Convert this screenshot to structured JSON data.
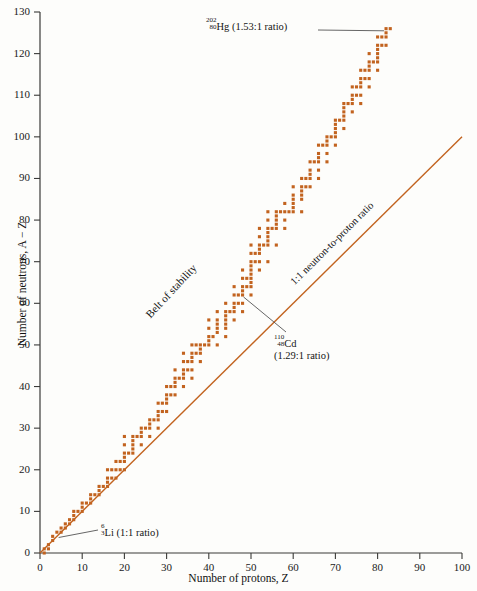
{
  "chart_data": {
    "type": "scatter",
    "title": "",
    "xlabel": "Number of protons, Z",
    "ylabel": "Number of neutrons, A − Z",
    "xlim": [
      0,
      100
    ],
    "ylim": [
      0,
      130
    ],
    "xticks": [
      0,
      10,
      20,
      30,
      40,
      50,
      60,
      70,
      80,
      90,
      100
    ],
    "yticks": [
      0,
      10,
      20,
      30,
      40,
      50,
      60,
      70,
      80,
      90,
      100,
      110,
      120,
      130
    ],
    "grid": false,
    "legend_position": "none",
    "series": [
      {
        "name": "Stable nuclides (belt of stability)",
        "color": "#C2631F",
        "marker": "square",
        "points": [
          [
            1,
            0
          ],
          [
            1,
            1
          ],
          [
            2,
            1
          ],
          [
            2,
            2
          ],
          [
            3,
            3
          ],
          [
            3,
            4
          ],
          [
            4,
            5
          ],
          [
            5,
            5
          ],
          [
            5,
            6
          ],
          [
            6,
            6
          ],
          [
            6,
            7
          ],
          [
            7,
            7
          ],
          [
            7,
            8
          ],
          [
            8,
            8
          ],
          [
            8,
            9
          ],
          [
            8,
            10
          ],
          [
            9,
            10
          ],
          [
            10,
            10
          ],
          [
            10,
            11
          ],
          [
            10,
            12
          ],
          [
            11,
            12
          ],
          [
            12,
            12
          ],
          [
            12,
            13
          ],
          [
            12,
            14
          ],
          [
            13,
            14
          ],
          [
            14,
            14
          ],
          [
            14,
            15
          ],
          [
            14,
            16
          ],
          [
            15,
            16
          ],
          [
            16,
            16
          ],
          [
            16,
            17
          ],
          [
            16,
            18
          ],
          [
            16,
            20
          ],
          [
            17,
            18
          ],
          [
            17,
            20
          ],
          [
            18,
            18
          ],
          [
            18,
            20
          ],
          [
            18,
            22
          ],
          [
            19,
            20
          ],
          [
            19,
            22
          ],
          [
            20,
            20
          ],
          [
            20,
            22
          ],
          [
            20,
            23
          ],
          [
            20,
            24
          ],
          [
            20,
            26
          ],
          [
            20,
            28
          ],
          [
            21,
            24
          ],
          [
            22,
            24
          ],
          [
            22,
            25
          ],
          [
            22,
            26
          ],
          [
            22,
            27
          ],
          [
            22,
            28
          ],
          [
            23,
            28
          ],
          [
            24,
            26
          ],
          [
            24,
            28
          ],
          [
            24,
            29
          ],
          [
            24,
            30
          ],
          [
            25,
            30
          ],
          [
            26,
            28
          ],
          [
            26,
            30
          ],
          [
            26,
            31
          ],
          [
            26,
            32
          ],
          [
            27,
            32
          ],
          [
            28,
            30
          ],
          [
            28,
            32
          ],
          [
            28,
            33
          ],
          [
            28,
            34
          ],
          [
            28,
            36
          ],
          [
            29,
            34
          ],
          [
            29,
            36
          ],
          [
            30,
            34
          ],
          [
            30,
            36
          ],
          [
            30,
            37
          ],
          [
            30,
            38
          ],
          [
            30,
            40
          ],
          [
            31,
            38
          ],
          [
            31,
            40
          ],
          [
            32,
            38
          ],
          [
            32,
            40
          ],
          [
            32,
            41
          ],
          [
            32,
            42
          ],
          [
            32,
            44
          ],
          [
            33,
            42
          ],
          [
            34,
            40
          ],
          [
            34,
            42
          ],
          [
            34,
            43
          ],
          [
            34,
            44
          ],
          [
            34,
            46
          ],
          [
            34,
            48
          ],
          [
            35,
            44
          ],
          [
            35,
            46
          ],
          [
            36,
            42
          ],
          [
            36,
            44
          ],
          [
            36,
            46
          ],
          [
            36,
            47
          ],
          [
            36,
            48
          ],
          [
            36,
            50
          ],
          [
            37,
            48
          ],
          [
            37,
            50
          ],
          [
            38,
            46
          ],
          [
            38,
            48
          ],
          [
            38,
            49
          ],
          [
            38,
            50
          ],
          [
            39,
            50
          ],
          [
            40,
            50
          ],
          [
            40,
            51
          ],
          [
            40,
            52
          ],
          [
            40,
            54
          ],
          [
            40,
            56
          ],
          [
            41,
            52
          ],
          [
            42,
            50
          ],
          [
            42,
            53
          ],
          [
            42,
            54
          ],
          [
            42,
            55
          ],
          [
            42,
            56
          ],
          [
            42,
            58
          ],
          [
            44,
            52
          ],
          [
            44,
            54
          ],
          [
            44,
            55
          ],
          [
            44,
            56
          ],
          [
            44,
            57
          ],
          [
            44,
            58
          ],
          [
            44,
            60
          ],
          [
            45,
            58
          ],
          [
            46,
            56
          ],
          [
            46,
            58
          ],
          [
            46,
            59
          ],
          [
            46,
            60
          ],
          [
            46,
            62
          ],
          [
            46,
            64
          ],
          [
            47,
            60
          ],
          [
            47,
            62
          ],
          [
            48,
            58
          ],
          [
            48,
            60
          ],
          [
            48,
            62
          ],
          [
            48,
            63
          ],
          [
            48,
            64
          ],
          [
            48,
            66
          ],
          [
            48,
            68
          ],
          [
            49,
            64
          ],
          [
            49,
            66
          ],
          [
            50,
            62
          ],
          [
            50,
            64
          ],
          [
            50,
            65
          ],
          [
            50,
            66
          ],
          [
            50,
            67
          ],
          [
            50,
            68
          ],
          [
            50,
            69
          ],
          [
            50,
            70
          ],
          [
            50,
            72
          ],
          [
            50,
            74
          ],
          [
            51,
            70
          ],
          [
            51,
            72
          ],
          [
            52,
            68
          ],
          [
            52,
            70
          ],
          [
            52,
            72
          ],
          [
            52,
            73
          ],
          [
            52,
            74
          ],
          [
            52,
            76
          ],
          [
            52,
            78
          ],
          [
            53,
            74
          ],
          [
            54,
            70
          ],
          [
            54,
            74
          ],
          [
            54,
            75
          ],
          [
            54,
            76
          ],
          [
            54,
            77
          ],
          [
            54,
            78
          ],
          [
            54,
            80
          ],
          [
            54,
            82
          ],
          [
            55,
            78
          ],
          [
            56,
            74
          ],
          [
            56,
            78
          ],
          [
            56,
            79
          ],
          [
            56,
            80
          ],
          [
            56,
            81
          ],
          [
            56,
            82
          ],
          [
            57,
            82
          ],
          [
            58,
            78
          ],
          [
            58,
            80
          ],
          [
            58,
            82
          ],
          [
            58,
            84
          ],
          [
            59,
            82
          ],
          [
            60,
            82
          ],
          [
            60,
            83
          ],
          [
            60,
            84
          ],
          [
            60,
            85
          ],
          [
            60,
            86
          ],
          [
            60,
            88
          ],
          [
            62,
            82
          ],
          [
            62,
            85
          ],
          [
            62,
            86
          ],
          [
            62,
            87
          ],
          [
            62,
            88
          ],
          [
            62,
            90
          ],
          [
            63,
            88
          ],
          [
            63,
            90
          ],
          [
            64,
            88
          ],
          [
            64,
            90
          ],
          [
            64,
            91
          ],
          [
            64,
            92
          ],
          [
            64,
            94
          ],
          [
            65,
            94
          ],
          [
            66,
            90
          ],
          [
            66,
            92
          ],
          [
            66,
            94
          ],
          [
            66,
            95
          ],
          [
            66,
            96
          ],
          [
            66,
            98
          ],
          [
            67,
            98
          ],
          [
            68,
            94
          ],
          [
            68,
            96
          ],
          [
            68,
            98
          ],
          [
            68,
            99
          ],
          [
            68,
            100
          ],
          [
            69,
            100
          ],
          [
            70,
            98
          ],
          [
            70,
            100
          ],
          [
            70,
            101
          ],
          [
            70,
            102
          ],
          [
            70,
            103
          ],
          [
            70,
            104
          ],
          [
            71,
            104
          ],
          [
            72,
            102
          ],
          [
            72,
            104
          ],
          [
            72,
            105
          ],
          [
            72,
            106
          ],
          [
            72,
            107
          ],
          [
            72,
            108
          ],
          [
            73,
            108
          ],
          [
            74,
            106
          ],
          [
            74,
            108
          ],
          [
            74,
            109
          ],
          [
            74,
            110
          ],
          [
            74,
            112
          ],
          [
            75,
            110
          ],
          [
            75,
            112
          ],
          [
            76,
            108
          ],
          [
            76,
            110
          ],
          [
            76,
            112
          ],
          [
            76,
            113
          ],
          [
            76,
            114
          ],
          [
            76,
            116
          ],
          [
            77,
            114
          ],
          [
            77,
            116
          ],
          [
            78,
            112
          ],
          [
            78,
            114
          ],
          [
            78,
            116
          ],
          [
            78,
            117
          ],
          [
            78,
            118
          ],
          [
            78,
            120
          ],
          [
            79,
            118
          ],
          [
            80,
            116
          ],
          [
            80,
            118
          ],
          [
            80,
            119
          ],
          [
            80,
            120
          ],
          [
            80,
            121
          ],
          [
            80,
            122
          ],
          [
            80,
            124
          ],
          [
            81,
            122
          ],
          [
            81,
            124
          ],
          [
            82,
            122
          ],
          [
            82,
            124
          ],
          [
            82,
            125
          ],
          [
            82,
            126
          ],
          [
            83,
            126
          ]
        ]
      }
    ],
    "reference_line": {
      "name": "1:1 neutron-to-proton ratio",
      "color": "#C2631F",
      "from": [
        0,
        0
      ],
      "to": [
        100,
        100
      ],
      "label": "1:1 neutron-to-proton ratio"
    },
    "annotations": [
      {
        "id": "hg202",
        "mass": "202",
        "atomic_number": "80",
        "element": "Hg",
        "ratio_text": "(1.53:1 ratio)",
        "target_point": [
          82,
          125
        ]
      },
      {
        "id": "cd110",
        "mass": "110",
        "atomic_number": "48",
        "element": "Cd",
        "ratio_text": "(1.29:1 ratio)",
        "target_point": [
          48,
          62
        ]
      },
      {
        "id": "li6",
        "mass": "6",
        "atomic_number": "3",
        "element": "Li",
        "ratio_text": "(1:1 ratio)",
        "target_point": [
          3,
          3
        ]
      }
    ],
    "belt_label": "Belt of stability"
  },
  "axes": {
    "y_title": "Number of neutrons, A − Z",
    "x_title": "Number of protons, Z",
    "y_tick_labels": [
      "0",
      "10",
      "20",
      "30",
      "40",
      "50",
      "60",
      "70",
      "80",
      "90",
      "100",
      "110",
      "120",
      "130"
    ],
    "x_tick_labels": [
      "0",
      "10",
      "20",
      "30",
      "40",
      "50",
      "60",
      "70",
      "80",
      "90",
      "100"
    ]
  },
  "labels": {
    "belt_of_stability": "Belt of stability",
    "ratio_line": "1:1 neutron-to-proton ratio",
    "hg_mass": "202",
    "hg_atnum": "80",
    "hg_element": "Hg (1.53:1 ratio)",
    "cd_mass": "110",
    "cd_atnum": "48",
    "cd_element": "Cd",
    "cd_ratio": "(1.29:1 ratio)",
    "li_mass": "6",
    "li_atnum": "3",
    "li_element": "Li (1:1 ratio)"
  },
  "colors": {
    "data_point": "#C2631F",
    "reference_line": "#C2631F",
    "axis": "#3a3a38",
    "text": "#151515",
    "leader_line": "#555555",
    "background": "#fdfdfb"
  }
}
